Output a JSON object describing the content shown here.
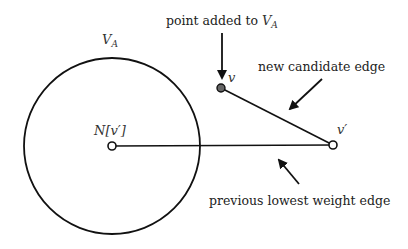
{
  "diagram": {
    "set_label": "V",
    "set_label_sub": "A",
    "nodes": {
      "n_vprime": {
        "label": "N[v′]",
        "x": 112,
        "y": 146,
        "fill": "#ffffff"
      },
      "v": {
        "label": "v",
        "x": 221,
        "y": 88,
        "fill": "#666666"
      },
      "vprime": {
        "label": "v′",
        "x": 333,
        "y": 145,
        "fill": "#ffffff"
      }
    },
    "annotations": {
      "point_added_prefix": "point added to ",
      "point_added_var": "V",
      "point_added_sub": "A",
      "new_candidate_edge": "new candidate edge",
      "previous_lowest_weight_edge": "previous lowest weight edge"
    },
    "colors": {
      "stroke": "#111111",
      "text": "#222222",
      "filled_node": "#666666"
    }
  }
}
